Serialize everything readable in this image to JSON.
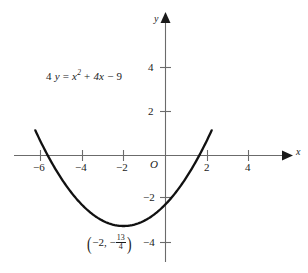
{
  "chart_data": {
    "type": "line",
    "title": "",
    "subtitle": "",
    "equation_label": {
      "lead_coefficient": "4",
      "y_var": "y",
      "equals": "=",
      "x_var": "x",
      "exponent": "2",
      "plus": "+",
      "linear_term": "4x",
      "minus": "−",
      "constant": "9",
      "plain": "4 y = x² + 4x − 9"
    },
    "function": "y = (x^2 + 4x - 9)/4",
    "vertex": {
      "x": -2,
      "y": -3.25,
      "label_open_paren": "(",
      "label_x": "−2,",
      "label_minus": "−",
      "fraction_numerator": "13",
      "fraction_denominator": "4",
      "label_close_paren": ")",
      "plain": "(−2, −13/4)"
    },
    "roots": [
      -6.6056,
      2.6056
    ],
    "xlabel": "x",
    "ylabel": "y",
    "xlim": [
      -7.2,
      5.9
    ],
    "ylim": [
      -4.8,
      6.4
    ],
    "xticks": [
      -6,
      -4,
      -2,
      2,
      4
    ],
    "yticks": [
      4,
      2,
      -2,
      -4
    ],
    "xtick_labels": [
      "−6",
      "−4",
      "−2",
      "2",
      "4"
    ],
    "ytick_labels": [
      "4",
      "2",
      "−2",
      "−4"
    ],
    "origin_label": "O",
    "grid": false,
    "legend": null,
    "curve_domain": [
      -6.2,
      2.2
    ],
    "series": [
      {
        "name": "4y = x^2 + 4x - 9",
        "x": [
          -6.2,
          -6.0,
          -5.5,
          -5.0,
          -4.5,
          -4.0,
          -3.5,
          -3.0,
          -2.5,
          -2.0,
          -1.5,
          -1.0,
          -0.5,
          0.0,
          0.5,
          1.0,
          1.5,
          2.0,
          2.2
        ],
        "y": [
          1.16,
          0.75,
          -0.19,
          -0.75,
          -1.31,
          -1.75,
          -2.06,
          -2.25,
          -2.44,
          -2.56,
          -2.44,
          -2.25,
          -2.06,
          -1.75,
          -1.31,
          -0.75,
          -0.19,
          0.75,
          1.16
        ]
      }
    ],
    "colors": {
      "curve": "#111111",
      "axis": "#6b6b6b",
      "text": "#1a1a1a",
      "background": "#ffffff"
    }
  },
  "axes": {
    "x_axis_name": "x",
    "y_axis_name": "y",
    "origin": "O"
  }
}
